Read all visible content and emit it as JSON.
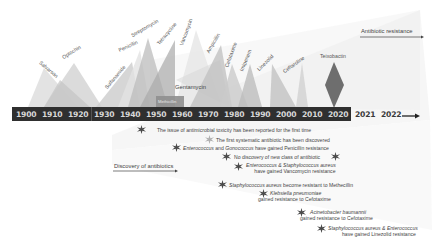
{
  "diagram": {
    "type": "timeline",
    "axis": {
      "years": [
        "1900",
        "1910",
        "1920",
        "1930",
        "1940",
        "1950",
        "1960",
        "1970",
        "1980",
        "1990",
        "2000",
        "2010",
        "2020",
        "2021",
        "2022"
      ]
    },
    "headers": {
      "antibiotic_resistance": "Antibiotic resistance",
      "discovery_of_antibiotics": "Discovery of antibiotics"
    },
    "antibiotics": [
      {
        "name": "Salvarsan",
        "year": 1910
      },
      {
        "name": "Optochin",
        "year": 1920
      },
      {
        "name": "Sulfanamide",
        "year": 1935
      },
      {
        "name": "Penicillin",
        "year": 1942
      },
      {
        "name": "Streptomycin",
        "year": 1950
      },
      {
        "name": "Tetracycline",
        "year": 1955
      },
      {
        "name": "Vancomycin",
        "year": 1962
      },
      {
        "name": "Gentamycin",
        "year": 1963
      },
      {
        "name": "Methicillin",
        "year": 1960
      },
      {
        "name": "Ampicillin",
        "year": 1975
      },
      {
        "name": "Cefotaxime",
        "year": 1980
      },
      {
        "name": "Imipenem",
        "year": 1985
      },
      {
        "name": "Linezolid",
        "year": 2000
      },
      {
        "name": "Ceftaroline",
        "year": 2010
      },
      {
        "name": "Teixobactin",
        "year": 2020
      }
    ],
    "events": [
      {
        "text": "The issue of antimicrobial toxicity has been reported for the first time"
      },
      {
        "text": "The first systematic antibiotic has been discovered"
      },
      {
        "text_italic": "Enterococcus",
        "text": " and Genococcus have gained Penicillin resistance",
        "text_italic2": "Gonococcus"
      },
      {
        "text": "No discovery of new class of antibiotic"
      },
      {
        "line1": "Enterococcus & Staphylococcus aureus",
        "line2": "have gained Vancomycin resistance"
      },
      {
        "text_italic": "Staphylococcus aureus",
        "text": " become resistant to Methecillin"
      },
      {
        "line1": "Klebsiella pneumoniae",
        "line2": "gained resistance to Cefotaxime"
      },
      {
        "line1": "Acinetobacter baumannii",
        "line2": "gained resistance to Cefotaxime"
      },
      {
        "line1": "Staphylococcus aureus & Enterococcus",
        "line2": "have gained Linezolid resistance"
      }
    ],
    "colors": {
      "axis_bar": "#2f2f2f",
      "axis_text": "#d8d8d8",
      "teixobactin": "#6e6e6e",
      "triangle_light": "#d9d9d9",
      "triangle_mid": "#b8b8b8",
      "star_dark": "#4a4a4a",
      "star_light": "#b0b0b0"
    }
  }
}
